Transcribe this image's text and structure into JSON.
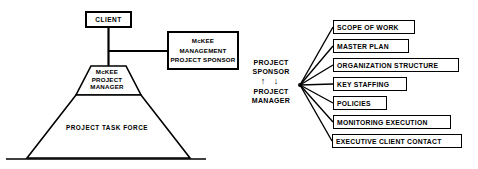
{
  "diagram": {
    "left_chart": {
      "client": {
        "label": "CLIENT"
      },
      "sponsor_box": {
        "line1": "McKEE",
        "line2": "MANAGEMENT",
        "line3": "PROJECT SPONSOR"
      },
      "pyramid_cap": {
        "line1": "McKEE",
        "line2": "PROJECT",
        "line3": "MANAGER"
      },
      "pyramid_base": {
        "label": "PROJECT TASK FORCE"
      }
    },
    "hub": {
      "line1": "PROJECT",
      "line2": "SPONSOR",
      "arrows": "↑ ↓",
      "line3": "PROJECT",
      "line4": "MANAGER"
    },
    "items": [
      {
        "label": "SCOPE OF WORK",
        "left": 333,
        "top": 20,
        "width": 82
      },
      {
        "label": "MASTER PLAN",
        "left": 333,
        "top": 39,
        "width": 76
      },
      {
        "label": "ORGANIZATION STRUCTURE",
        "left": 333,
        "top": 58,
        "width": 126
      },
      {
        "label": "KEY STAFFING",
        "left": 333,
        "top": 77,
        "width": 74
      },
      {
        "label": "POLICIES",
        "left": 333,
        "top": 96,
        "width": 54
      },
      {
        "label": "MONITORING EXECUTION",
        "left": 333,
        "top": 115,
        "width": 118
      },
      {
        "label": "EXECUTIVE CLIENT CONTACT",
        "left": 332,
        "top": 134,
        "width": 130
      }
    ],
    "colors": {
      "stroke": "#000000",
      "background": "#ffffff",
      "text": "#000000"
    }
  }
}
